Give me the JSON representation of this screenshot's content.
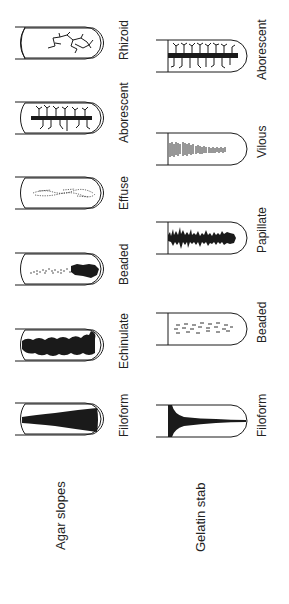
{
  "diagram": {
    "groups": [
      {
        "title": "Agar slopes",
        "tubes": [
          {
            "label": "Rhizoid"
          },
          {
            "label": "Aborescent"
          },
          {
            "label": "Effuse"
          },
          {
            "label": "Beaded"
          },
          {
            "label": "Echinulate"
          },
          {
            "label": "Filoform"
          }
        ]
      },
      {
        "title": "Gelatin stab",
        "tubes": [
          {
            "label": "Aborescent"
          },
          {
            "label": "Vilous"
          },
          {
            "label": "Papillate"
          },
          {
            "label": "Beaded"
          },
          {
            "label": "Filoform"
          }
        ]
      }
    ],
    "colors": {
      "ink": "#1a1a1a",
      "background": "#ffffff"
    }
  }
}
